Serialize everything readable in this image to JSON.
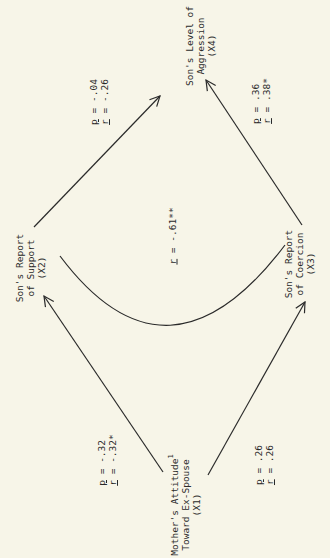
{
  "diagram": {
    "type": "path-diagram",
    "orientation": "rotated -90deg",
    "colors": {
      "background": "#f7f5e8",
      "ink": "#2a2a2a"
    },
    "nodes": [
      {
        "id": "X1",
        "lines": [
          "Mother's Attitude",
          "Toward Ex-Spouse",
          "(X1)"
        ],
        "superscript": "1"
      },
      {
        "id": "X2",
        "lines": [
          "Son's Report",
          "of Support",
          "(X2)"
        ]
      },
      {
        "id": "X3",
        "lines": [
          "Son's Report",
          "of Coercion",
          "(X3)"
        ]
      },
      {
        "id": "X4",
        "lines": [
          "Son's Level of",
          "Aggression",
          "(X4)"
        ]
      }
    ],
    "edges": [
      {
        "from": "X1",
        "to": "X2",
        "p_symbol": "p",
        "p_value": "= -.32",
        "r_symbol": "r",
        "r_value": "= -.32*"
      },
      {
        "from": "X1",
        "to": "X3",
        "p_symbol": "p",
        "p_value": "= .26",
        "r_symbol": "r",
        "r_value": "= .26"
      },
      {
        "from": "X2",
        "to": "X4",
        "p_symbol": "p",
        "p_value": "= -.04",
        "r_symbol": "r",
        "r_value": "= -.26"
      },
      {
        "from": "X3",
        "to": "X4",
        "p_symbol": "p",
        "p_value": "= .36",
        "r_symbol": "r",
        "r_value": "= .38*"
      }
    ],
    "correlation": {
      "between": [
        "X2",
        "X3"
      ],
      "r_symbol": "r",
      "r_value": "= -.61**"
    }
  }
}
